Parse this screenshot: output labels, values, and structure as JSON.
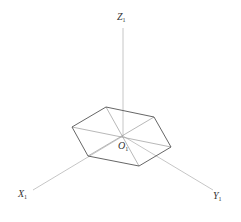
{
  "diagram": {
    "type": "axonometric-axes-with-hexagon",
    "origin": {
      "x": 123,
      "y": 136
    },
    "axes": [
      {
        "name": "Z",
        "subscript": "1",
        "end": {
          "x": 123,
          "y": 28
        }
      },
      {
        "name": "X",
        "subscript": "1",
        "end": {
          "x": 33,
          "y": 190
        }
      },
      {
        "name": "Y",
        "subscript": "1",
        "end": {
          "x": 213,
          "y": 190
        }
      }
    ],
    "hexagon": {
      "vertices": [
        {
          "x": 106,
          "y": 107
        },
        {
          "x": 154,
          "y": 117
        },
        {
          "x": 171,
          "y": 147
        },
        {
          "x": 139,
          "y": 166
        },
        {
          "x": 88,
          "y": 156
        },
        {
          "x": 72,
          "y": 127
        }
      ]
    },
    "colors": {
      "axis": "#b8b8b8",
      "hexagon": "#555555",
      "label": "#333333",
      "background": "#ffffff"
    }
  },
  "labels": {
    "z": {
      "main": "Z",
      "sub": "1"
    },
    "o": {
      "main": "O",
      "sub": "1"
    },
    "x": {
      "main": "X",
      "sub": "1"
    },
    "y": {
      "main": "Y",
      "sub": "1"
    }
  }
}
